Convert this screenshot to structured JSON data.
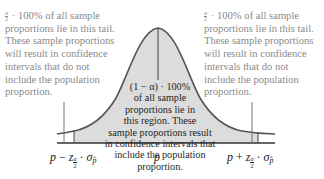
{
  "figure": {
    "type": "normal-distribution-confidence-interval-diagram",
    "colors": {
      "curve_stroke": "#555555",
      "center_fill": "#dcdcdc",
      "tail_fill": "#ffffff",
      "side_text": "#8a8a8a",
      "center_text": "#1e1e1e",
      "axis": "#333333"
    }
  },
  "left_annotation": {
    "fraction_num": "α",
    "fraction_den": "2",
    "text": " · 100% of all sample proportions lie in this tail. These sample proportions will result in confidence intervals that do not include the population proportion."
  },
  "right_annotation": {
    "fraction_num": "α",
    "fraction_den": "2",
    "text": " · 100% of all sample proportions lie in this tail. These sample proportions will result in confidence intervals that do not include the population proportion."
  },
  "center_annotation": {
    "line1": "(1 − α) · 100%",
    "line2": "of all sample",
    "line3": "proportions lie in",
    "line4": "this region. These",
    "line5": "sample proportions result",
    "line6": "in confidence intervals that",
    "line7": "include the population proportion."
  },
  "axis_labels": {
    "left": {
      "p": "p",
      "op": "−",
      "z": "z",
      "frac_num": "α",
      "frac_den": "2",
      "dot": "·",
      "sigma": "σ",
      "sigma_sub": "p̂"
    },
    "center": {
      "p": "p"
    },
    "right": {
      "p": "p",
      "op": "+",
      "z": "z",
      "frac_num": "α",
      "frac_den": "2",
      "dot": "·",
      "sigma": "σ",
      "sigma_sub": "p̂"
    }
  }
}
